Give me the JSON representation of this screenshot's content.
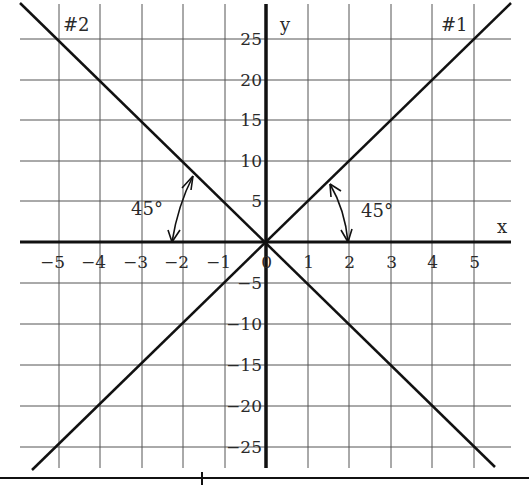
{
  "chart_data": {
    "type": "line",
    "title": "",
    "xlabel": "x",
    "ylabel": "y",
    "xlim": [
      -6,
      6
    ],
    "ylim": [
      -28,
      28
    ],
    "grid": true,
    "x_ticks": [
      "-5",
      "-4",
      "-3",
      "-2",
      "-1",
      "0",
      "1",
      "2",
      "3",
      "4",
      "5"
    ],
    "y_ticks_positive": [
      "25",
      "20",
      "15",
      "10",
      "5"
    ],
    "y_ticks_negative": [
      "-5",
      "-10",
      "-15",
      "-20",
      "-25"
    ],
    "series": [
      {
        "name": "#1",
        "equation": "y = 5x",
        "x": [
          -5,
          0,
          5
        ],
        "y": [
          -25,
          0,
          25
        ]
      },
      {
        "name": "#2",
        "equation": "y = -5x",
        "x": [
          -5,
          0,
          5
        ],
        "y": [
          25,
          0,
          -25
        ]
      }
    ],
    "annotations": [
      {
        "text": "45°",
        "near": "line #1, angle with positive x-axis"
      },
      {
        "text": "45°",
        "near": "line #2, angle with negative x-axis"
      }
    ]
  },
  "labels": {
    "line1": "#1",
    "line2": "#2",
    "x_axis": "x",
    "y_axis": "y",
    "angle_right": "45°",
    "angle_left": "45°"
  },
  "ticks": {
    "x": [
      {
        "label": "-5",
        "x": 59
      },
      {
        "label": "-4",
        "x": 100
      },
      {
        "label": "-3",
        "x": 142
      },
      {
        "label": "-2",
        "x": 183
      },
      {
        "label": "-1",
        "x": 225
      },
      {
        "label": "0",
        "x": 266
      },
      {
        "label": "1",
        "x": 308
      },
      {
        "label": "2",
        "x": 349
      },
      {
        "label": "3",
        "x": 391
      },
      {
        "label": "4",
        "x": 432
      },
      {
        "label": "5",
        "x": 474
      }
    ],
    "y": [
      {
        "label": "25",
        "y": 39
      },
      {
        "label": "20",
        "y": 80
      },
      {
        "label": "15",
        "y": 120
      },
      {
        "label": "10",
        "y": 161
      },
      {
        "label": "5",
        "y": 201
      },
      {
        "label": "-5",
        "y": 283
      },
      {
        "label": "-10",
        "y": 324
      },
      {
        "label": "-15",
        "y": 365
      },
      {
        "label": "-20",
        "y": 406
      },
      {
        "label": "-25",
        "y": 447
      }
    ]
  }
}
